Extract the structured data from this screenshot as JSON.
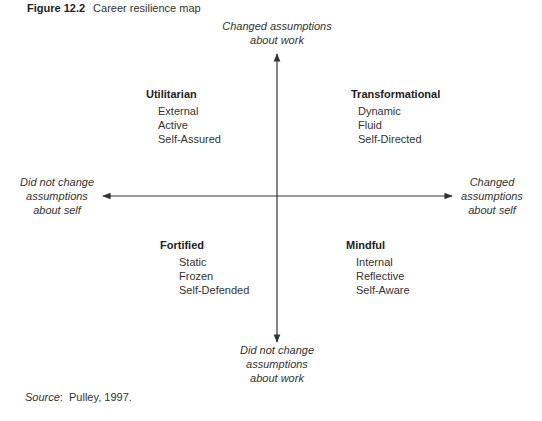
{
  "figure": {
    "number_label": "Figure 12.2",
    "title": "Career resilience map"
  },
  "axes": {
    "top": {
      "line1": "Changed assumptions",
      "line2": "about work"
    },
    "bottom": {
      "line1": "Did not change",
      "line2": "assumptions",
      "line3": "about work"
    },
    "left": {
      "line1": "Did not change",
      "line2": "assumptions",
      "line3": "about self"
    },
    "right": {
      "line1": "Changed",
      "line2": "assumptions",
      "line3": "about self"
    }
  },
  "quadrants": [
    {
      "position": "top-left",
      "heading": "Utilitarian",
      "items": [
        "External",
        "Active",
        "Self-Assured"
      ]
    },
    {
      "position": "top-right",
      "heading": "Transformational",
      "items": [
        "Dynamic",
        "Fluid",
        "Self-Directed"
      ]
    },
    {
      "position": "bottom-left",
      "heading": "Fortified",
      "items": [
        "Static",
        "Frozen",
        "Self-Defended"
      ]
    },
    {
      "position": "bottom-right",
      "heading": "Mindful",
      "items": [
        "Internal",
        "Reflective",
        "Self-Aware"
      ]
    }
  ],
  "source": {
    "label": "Source",
    "text": "Pulley, 1997."
  },
  "colors": {
    "line": "#333333",
    "text": "#333333"
  }
}
